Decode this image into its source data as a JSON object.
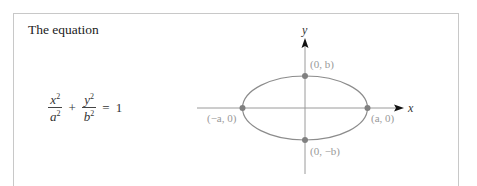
{
  "intro_text": "The equation",
  "equation": {
    "term1": {
      "numerator": "x",
      "denominator": "a",
      "exponent": "2"
    },
    "plus": "+",
    "term2": {
      "numerator": "y",
      "denominator": "b",
      "exponent": "2"
    },
    "equals": "=",
    "rhs": "1"
  },
  "diagram": {
    "x_axis_label": "x",
    "y_axis_label": "y",
    "points": {
      "top": "(0, b)",
      "bottom": "(0, −b)",
      "left": "(−a, 0)",
      "right": "(a, 0)"
    },
    "colors": {
      "curve": "#8c8c8c",
      "axis": "#9a9a9a",
      "vertex": "#808080",
      "arrow": "#111111",
      "frame": "#c8c8c8"
    }
  }
}
